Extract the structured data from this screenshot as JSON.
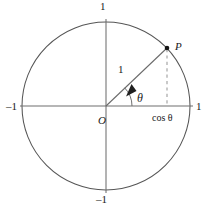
{
  "figure": {
    "type": "geometric-diagram",
    "colors": {
      "stroke": "#4a4a4a",
      "axis": "#6b6b6b",
      "dashed": "#c0c0c0",
      "text": "#1a1a1a",
      "background": "#ffffff"
    }
  },
  "labels": {
    "axis_top": "1",
    "axis_bottom": "–1",
    "axis_left": "–1",
    "axis_right": "1",
    "origin": "O",
    "point": "P",
    "radius": "1",
    "angle": "θ",
    "projection": "cos θ"
  },
  "geometry": {
    "center": {
      "x": 106,
      "y": 106
    },
    "radius": 84,
    "point_p": {
      "x": 167,
      "y": 48
    },
    "angle_degrees": 44,
    "arc_radius": 26,
    "dashed_line": {
      "x": 167,
      "y_top": 48,
      "y_bottom": 106
    },
    "axis_x": {
      "x1": 20,
      "x2": 192,
      "y": 106
    },
    "axis_y": {
      "y1": 20,
      "y2": 192,
      "x": 106
    }
  },
  "icons": {
    "direction_arrow": "arrow-along-radius-icon",
    "point_marker": "point-dot-icon"
  }
}
